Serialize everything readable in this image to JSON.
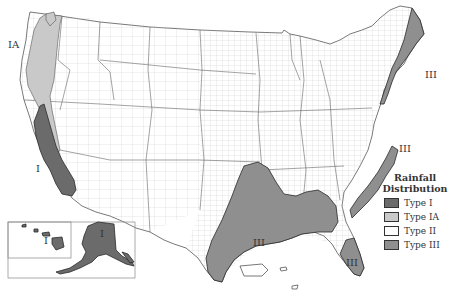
{
  "map": {
    "title": "Rainfall Distribution",
    "subject": "US rainfall distribution types by county",
    "colors": {
      "type_i": "#6b6b6b",
      "type_ia": "#c9c9c9",
      "type_ii": "#ffffff",
      "type_iii": "#8f8f8f"
    },
    "region_labels": [
      {
        "text": "IA",
        "x": 28,
        "y": 48
      },
      {
        "text": "I",
        "x": 38,
        "y": 172
      },
      {
        "text": "III",
        "x": 425,
        "y": 78
      },
      {
        "text": "III",
        "x": 403,
        "y": 152
      },
      {
        "text": "III",
        "x": 253,
        "y": 246
      },
      {
        "text": "III",
        "x": 352,
        "y": 266
      },
      {
        "text": "I",
        "x": 46,
        "y": 244
      },
      {
        "text": "I",
        "x": 100,
        "y": 237
      }
    ]
  },
  "legend": {
    "title_line1": "Rainfall",
    "title_line2": "Distribution",
    "items": [
      {
        "label": "Type I",
        "color": "#6b6b6b"
      },
      {
        "label": "Type IA",
        "color": "#c9c9c9"
      },
      {
        "label": "Type II",
        "color": "#ffffff"
      },
      {
        "label": "Type III",
        "color": "#8f8f8f"
      }
    ]
  }
}
